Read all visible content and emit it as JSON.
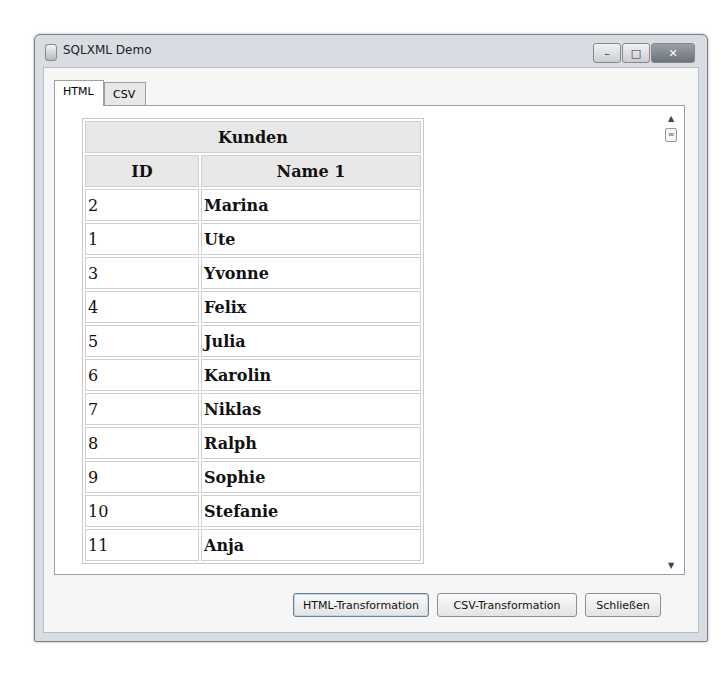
{
  "window": {
    "title": "SQLXML Demo",
    "controls": {
      "minimize": "–",
      "maximize": "□",
      "close": "✕"
    }
  },
  "tabs": [
    {
      "label": "HTML",
      "active": true
    },
    {
      "label": "CSV",
      "active": false
    }
  ],
  "table": {
    "caption": "Kunden",
    "columns": [
      "ID",
      "Name 1"
    ],
    "rows": [
      {
        "id": "2",
        "name": "Marina"
      },
      {
        "id": "1",
        "name": "Ute"
      },
      {
        "id": "3",
        "name": "Yvonne"
      },
      {
        "id": "4",
        "name": "Felix"
      },
      {
        "id": "5",
        "name": "Julia"
      },
      {
        "id": "6",
        "name": "Karolin"
      },
      {
        "id": "7",
        "name": "Niklas"
      },
      {
        "id": "8",
        "name": "Ralph"
      },
      {
        "id": "9",
        "name": "Sophie"
      },
      {
        "id": "10",
        "name": "Stefanie"
      },
      {
        "id": "11",
        "name": "Anja"
      }
    ]
  },
  "scrollbar": {
    "up": "▲",
    "thumb": "≡",
    "down": "▼"
  },
  "buttons": {
    "html_transform": "HTML-Transformation",
    "csv_transform": "CSV-Transformation",
    "close": "Schließen"
  }
}
